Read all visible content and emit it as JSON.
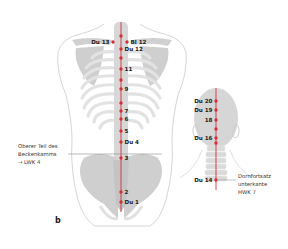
{
  "figure": {
    "panel_label": "b",
    "colors": {
      "meridian": "#d32f3a",
      "bone": "#d3d3d3",
      "bone_light": "#e6e6e6",
      "outline": "#c9c9c9",
      "text": "#222222"
    },
    "back_view": {
      "points": [
        {
          "label": "",
          "side": "right"
        },
        {
          "label": "Du 13",
          "side": "left"
        },
        {
          "label": "Bl 12",
          "side": "right"
        },
        {
          "label": "Du 12",
          "side": "right"
        },
        {
          "label": "",
          "side": "right"
        },
        {
          "label": "11",
          "side": "right"
        },
        {
          "label": "",
          "side": "right"
        },
        {
          "label": "9",
          "side": "right"
        },
        {
          "label": "",
          "side": "right"
        },
        {
          "label": "7",
          "side": "right"
        },
        {
          "label": "6",
          "side": "right"
        },
        {
          "label": "5",
          "side": "right"
        },
        {
          "label": "Du 4",
          "side": "right"
        },
        {
          "label": "3",
          "side": "right"
        },
        {
          "label": "2",
          "side": "right"
        },
        {
          "label": "Du 1",
          "side": "right"
        }
      ],
      "annotation": [
        "Oberer Teil des",
        "Beckenkamms",
        "→ LWK 4"
      ]
    },
    "head_view": {
      "points": [
        {
          "label": "Du 20"
        },
        {
          "label": "Du 19"
        },
        {
          "label": "18"
        },
        {
          "label": ""
        },
        {
          "label": "Du 16"
        },
        {
          "label": ""
        },
        {
          "label": "Du 14"
        }
      ],
      "annotation": [
        "Dornfortsatz",
        "unterkante",
        "HWK 7"
      ]
    }
  }
}
